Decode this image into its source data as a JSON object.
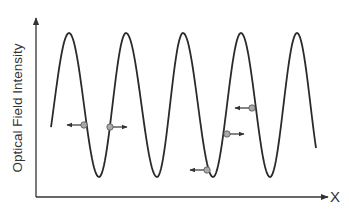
{
  "diagram": {
    "title": "",
    "y_axis_label": "Optical Field Intensity",
    "x_axis_label": "X",
    "colors": {
      "curve": "#2a2a2a",
      "axis": "#333333",
      "particle_fill": "#a9a9a9",
      "particle_stroke": "#555555",
      "arrow": "#333333"
    },
    "wave": {
      "description": "standing-wave optical intensity pattern (sinusoid)",
      "peaks_x": [
        69,
        126,
        183,
        241,
        297
      ],
      "troughs_x": [
        99,
        157,
        213,
        270
      ],
      "peak_y": 33,
      "trough_y": 177,
      "start": [
        51,
        107
      ],
      "end": [
        316,
        155
      ]
    },
    "particles": [
      {
        "x": 84,
        "y": 125,
        "direction": "left"
      },
      {
        "x": 110,
        "y": 127,
        "direction": "right"
      },
      {
        "x": 207,
        "y": 170,
        "direction": "left"
      },
      {
        "x": 227,
        "y": 134,
        "direction": "right"
      },
      {
        "x": 252,
        "y": 108,
        "direction": "left"
      }
    ]
  }
}
